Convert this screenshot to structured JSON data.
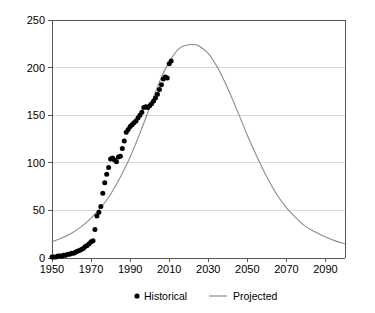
{
  "chart_data": {
    "type": "line",
    "title": "",
    "subtitle": "",
    "xlabel": "",
    "ylabel": "",
    "xlim": [
      1950,
      2100
    ],
    "ylim": [
      0,
      250
    ],
    "grid": true,
    "legend_position": "bottom-center",
    "x_ticks": [
      1950,
      1970,
      1990,
      2010,
      2030,
      2050,
      2070,
      2090
    ],
    "x_tick_labels": [
      "1950",
      "1970",
      "1990",
      "2010",
      "2030",
      "2050",
      "2070",
      "2090"
    ],
    "y_ticks": [
      0,
      50,
      100,
      150,
      200,
      250
    ],
    "y_tick_labels": [
      "0",
      "50",
      "100",
      "150",
      "200",
      "250"
    ],
    "series": [
      {
        "name": "Historical",
        "type": "scatter",
        "marker": "circle",
        "color": "#000000",
        "x": [
          1950,
          1951,
          1952,
          1953,
          1954,
          1955,
          1956,
          1957,
          1958,
          1959,
          1960,
          1961,
          1962,
          1963,
          1964,
          1965,
          1966,
          1967,
          1968,
          1969,
          1970,
          1971,
          1972,
          1973,
          1974,
          1975,
          1976,
          1977,
          1978,
          1979,
          1980,
          1981,
          1982,
          1983,
          1984,
          1985,
          1986,
          1987,
          1988,
          1989,
          1990,
          1991,
          1992,
          1993,
          1994,
          1995,
          1996,
          1997,
          1998,
          1999,
          2000,
          2001,
          2002,
          2003,
          2004,
          2005,
          2006,
          2007,
          2008,
          2009,
          2010,
          2011
        ],
        "values": [
          1,
          1,
          1,
          2,
          2,
          2,
          3,
          3,
          4,
          4,
          5,
          5,
          6,
          7,
          8,
          9,
          10,
          12,
          13,
          15,
          17,
          18,
          30,
          44,
          48,
          54,
          68,
          79,
          88,
          95,
          104,
          105,
          103,
          101,
          106,
          107,
          115,
          123,
          132,
          135,
          138,
          140,
          142,
          144,
          147,
          150,
          153,
          158,
          159,
          158,
          160,
          162,
          165,
          168,
          172,
          177,
          182,
          188,
          190,
          189,
          204,
          207
        ]
      },
      {
        "name": "Projected",
        "type": "line",
        "color": "#8c8c8c",
        "peak_year": 2023,
        "peak_value": 224,
        "x": [
          1950,
          1955,
          1960,
          1965,
          1970,
          1975,
          1980,
          1985,
          1990,
          1995,
          2000,
          2005,
          2010,
          2015,
          2020,
          2023,
          2025,
          2030,
          2035,
          2040,
          2045,
          2050,
          2055,
          2060,
          2065,
          2070,
          2075,
          2080,
          2085,
          2090,
          2095,
          2100
        ],
        "values": [
          17,
          21,
          26,
          33,
          42,
          53,
          67,
          85,
          106,
          131,
          158,
          185,
          206,
          220,
          224,
          224,
          223,
          215,
          199,
          178,
          154,
          129,
          106,
          85,
          67,
          53,
          42,
          33,
          27,
          22,
          18,
          15
        ]
      }
    ]
  },
  "axes": {
    "y_labels": [
      "250",
      "200",
      "150",
      "100",
      "50",
      "0"
    ],
    "x_labels": [
      "1950",
      "1970",
      "1990",
      "2010",
      "2030",
      "2050",
      "2070",
      "2090"
    ]
  },
  "legend": {
    "entries": [
      {
        "label": "Historical",
        "marker": "dot",
        "color": "#000000"
      },
      {
        "label": "Projected",
        "marker": "line",
        "color": "#8c8c8c"
      }
    ],
    "historical_label": "Historical",
    "projected_label": "Projected"
  },
  "colors": {
    "historical": "#000000",
    "projected": "#8c8c8c",
    "grid": "#d9d9d9",
    "axis": "#555555",
    "background": "#ffffff"
  }
}
